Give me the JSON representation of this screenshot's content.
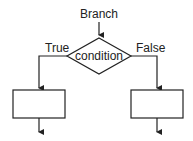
{
  "diagram": {
    "title": "Branch",
    "decision": {
      "label": "condition"
    },
    "branches": [
      {
        "label": "True"
      },
      {
        "label": "False"
      }
    ],
    "colors": {
      "stroke": "#222222",
      "fill": "#ffffff"
    }
  }
}
